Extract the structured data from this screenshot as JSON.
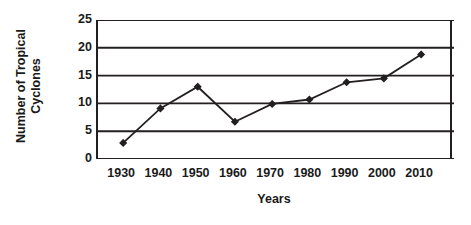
{
  "chart_data": {
    "type": "line",
    "title": "",
    "xlabel": "Years",
    "ylabel_line1": "Number of Tropical",
    "ylabel_line2": "Cyclones",
    "ylabel": "Number of Tropical Cyclones",
    "x": [
      1930,
      1940,
      1950,
      1960,
      1970,
      1980,
      1990,
      2000,
      2010
    ],
    "xticklabels": [
      "1930",
      "1940",
      "1950",
      "1960",
      "1970",
      "1980",
      "1990",
      "2000",
      "2010"
    ],
    "values": [
      2.9,
      9.1,
      13.0,
      6.7,
      9.9,
      10.7,
      13.8,
      14.5,
      18.8
    ],
    "yticks": [
      0,
      5,
      10,
      15,
      20,
      25
    ],
    "yticklabels": [
      "0",
      "5",
      "10",
      "15",
      "20",
      "25"
    ],
    "ylim": [
      0,
      25
    ],
    "xlim": [
      1927,
      2014
    ],
    "grid": "horizontal",
    "legend": "none",
    "series_name": "Number of Tropical Cyclones",
    "marker": "filled-diamond",
    "line_color": "#231f20",
    "marker_color": "#231f20",
    "grid_color": "#231f20",
    "background_color": "#ffffff"
  }
}
